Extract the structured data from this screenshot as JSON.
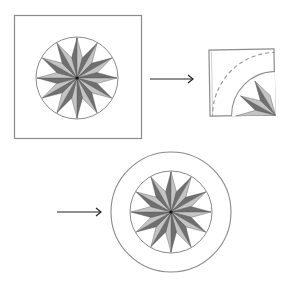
{
  "diagram": {
    "colors": {
      "outline": "#8a8a8a",
      "dark_point": "#6f6f6f",
      "light_point": "#c4c4c4",
      "background": "#ffffff",
      "arrow": "#222222"
    },
    "steps": [
      {
        "id": "step-1",
        "label": "Square block with 12-point star in circle"
      },
      {
        "id": "step-2",
        "label": "Folded quarter with dashed cutting arc"
      },
      {
        "id": "step-3",
        "label": "Star circle framed by outer ring"
      }
    ],
    "star": {
      "points": 12
    }
  }
}
